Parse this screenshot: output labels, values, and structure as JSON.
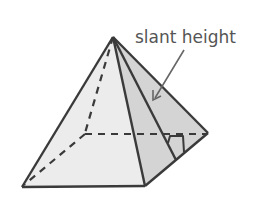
{
  "diagram": {
    "type": "square-pyramid",
    "label": "slant height",
    "colors": {
      "front_face": "#ececec",
      "right_face": "#d4d4d4",
      "edge": "#3a3a3a",
      "arrow": "#666666",
      "label": "#555555"
    },
    "vertices": {
      "apex": [
        113,
        37
      ],
      "front_left": [
        22,
        187
      ],
      "front_right": [
        145,
        186
      ],
      "back_right": [
        208,
        133
      ],
      "back_left_hidden": [
        85,
        134
      ]
    }
  }
}
